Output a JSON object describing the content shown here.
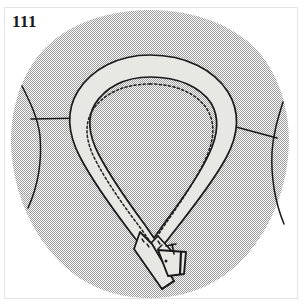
{
  "figure": {
    "number_label": "111",
    "title": "Neckline with tie band collar crossing at front with buckle",
    "style": "dithered halftone line drawing"
  },
  "colors": {
    "background": "#ffffff",
    "frame_border": "#e3e3e3",
    "body_fill_gray": "#a8a8a8",
    "body_fill_light": "#ffffff",
    "band_fill": "#e7e7e4",
    "outline": "#1a1a1a",
    "stitch": "#202020",
    "label_text": "#1a1a1a"
  },
  "parts": [
    {
      "name": "body-bodice",
      "label": "Bodice / torso block",
      "fill": "halftone-gray"
    },
    {
      "name": "left-shoulder-seam",
      "label": "Left shoulder seam line"
    },
    {
      "name": "right-shoulder-seam",
      "label": "Right shoulder seam line"
    },
    {
      "name": "collar-band",
      "label": "Tie band collar",
      "fill": "light-gray"
    },
    {
      "name": "collar-stitch-line",
      "label": "Topstitching dashed line",
      "style": "dashed"
    },
    {
      "name": "tie-end-left",
      "label": "Left tie end (crossing under)"
    },
    {
      "name": "tie-end-right",
      "label": "Right tie end (crossing over)"
    },
    {
      "name": "buckle",
      "label": "Buckle / slide fastener"
    }
  ],
  "annotations": {
    "stitch_dash_pattern": "2.2 2.4",
    "band_width_px": 22
  }
}
